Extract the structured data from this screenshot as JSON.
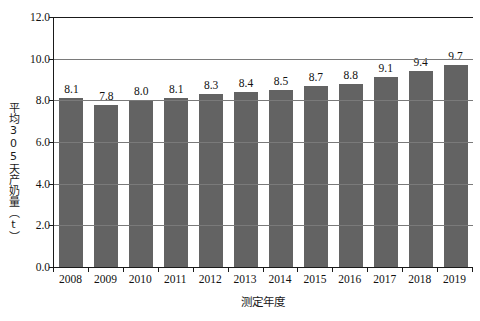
{
  "chart_data": {
    "type": "bar",
    "title": "",
    "subtitle": "",
    "xlabel": "测定年度",
    "ylabel": "平均305天产奶量（t）",
    "categories": [
      "2008",
      "2009",
      "2010",
      "2011",
      "2012",
      "2013",
      "2014",
      "2015",
      "2016",
      "2017",
      "2018",
      "2019"
    ],
    "values": [
      8.1,
      7.8,
      8.0,
      8.1,
      8.3,
      8.4,
      8.5,
      8.7,
      8.8,
      9.1,
      9.4,
      9.7
    ],
    "data_labels": [
      "8.1",
      "7.8",
      "8.0",
      "8.1",
      "8.3",
      "8.4",
      "8.5",
      "8.7",
      "8.8",
      "9.1",
      "9.4",
      "9.7"
    ],
    "ylim": [
      0,
      12
    ],
    "ytick_values": [
      0,
      2,
      4,
      6,
      8,
      10,
      12
    ],
    "ytick_labels": [
      "0.0",
      "2.0",
      "4.0",
      "6.0",
      "8.0",
      "10.0",
      "12.0"
    ],
    "grid": true,
    "legend": false,
    "legend_position": "none",
    "series": [
      {
        "name": "平均305天产奶量",
        "values": [
          8.1,
          7.8,
          8.0,
          8.1,
          8.3,
          8.4,
          8.5,
          8.7,
          8.8,
          9.1,
          9.4,
          9.7
        ]
      }
    ],
    "colors": {
      "bar": "#636363",
      "gridline": "#7a7a7a",
      "axis": "#1a1a1a",
      "background": "#ffffff",
      "text": "#111111"
    }
  }
}
